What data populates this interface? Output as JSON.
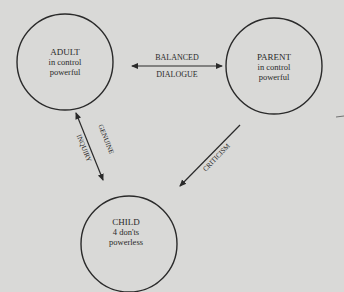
{
  "nodes": {
    "adult": {
      "title": "ADULT",
      "line1": "in control",
      "line2": "powerful"
    },
    "parent": {
      "title": "PARENT",
      "line1": "in control",
      "line2": "powerful"
    },
    "child": {
      "title": "CHILD",
      "line1": "4 don'ts",
      "line2": "powerless"
    }
  },
  "edges": {
    "adult_parent": {
      "label_top": "BALANCED",
      "label_bottom": "DIALOGUE",
      "direction": "bidirectional"
    },
    "adult_child": {
      "label_right": "GENUINE",
      "label_left": "INQUIRY",
      "direction": "bidirectional"
    },
    "parent_child": {
      "label": "CRITICISM",
      "direction": "parent-to-child"
    }
  },
  "colors": {
    "background": "#d9d9d7",
    "ink": "#2a2a2a"
  }
}
